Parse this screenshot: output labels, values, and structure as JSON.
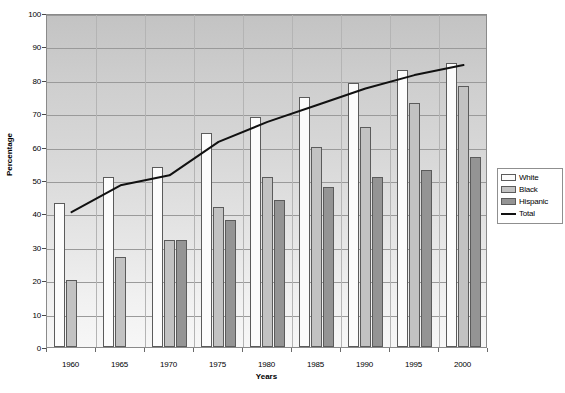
{
  "chart_data": {
    "type": "bar",
    "title": "",
    "xlabel": "Years",
    "ylabel": "Percentage",
    "ylim": [
      0,
      100
    ],
    "ytick_step": 10,
    "yticks": [
      0,
      10,
      20,
      30,
      40,
      50,
      60,
      70,
      80,
      90,
      100
    ],
    "categories": [
      "1960",
      "1965",
      "1970",
      "1975",
      "1980",
      "1985",
      "1990",
      "1995",
      "2000"
    ],
    "grid": true,
    "legend_position": "right",
    "series": [
      {
        "name": "White",
        "type": "bar",
        "color": "#fcfcfc",
        "values": [
          43,
          51,
          54,
          64,
          69,
          75,
          79,
          83,
          85
        ]
      },
      {
        "name": "Black",
        "type": "bar",
        "color": "#c2c2c2",
        "values": [
          20,
          27,
          32,
          42,
          51,
          60,
          66,
          73,
          78
        ]
      },
      {
        "name": "Hispanic",
        "type": "bar",
        "color": "#949494",
        "values": [
          null,
          null,
          32,
          38,
          44,
          48,
          51,
          53,
          57
        ]
      },
      {
        "name": "Total",
        "type": "line",
        "color": "#111111",
        "values": [
          41,
          49,
          52,
          62,
          68,
          73,
          78,
          82,
          85
        ]
      }
    ]
  },
  "legend": {
    "items": [
      {
        "label": "White",
        "marker": "swatch-white"
      },
      {
        "label": "Black",
        "marker": "swatch-black"
      },
      {
        "label": "Hispanic",
        "marker": "swatch-hispanic"
      },
      {
        "label": "Total",
        "marker": "line-marker"
      }
    ]
  }
}
